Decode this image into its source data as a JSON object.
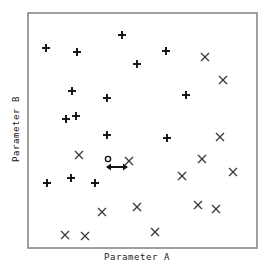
{
  "chart_data": {
    "type": "scatter",
    "title": "",
    "xlabel": "Parameter A",
    "ylabel": "Parameter B",
    "xlim": [
      0,
      100
    ],
    "ylim": [
      0,
      100
    ],
    "grid": false,
    "legend": null,
    "axis_ticks": {
      "x": [],
      "y": []
    },
    "frame": {
      "left": 28,
      "top": 13,
      "right": 257,
      "bottom": 248,
      "color": "#808080",
      "line_width": 1.5
    },
    "marker_color": "#111111",
    "series": [
      {
        "name": "plus-group",
        "marker": "plus",
        "color": "#111111",
        "points": [
          {
            "px": 46,
            "py": 48
          },
          {
            "px": 77,
            "py": 52
          },
          {
            "px": 122,
            "py": 35
          },
          {
            "px": 137,
            "py": 64
          },
          {
            "px": 166,
            "py": 51
          },
          {
            "px": 72,
            "py": 91
          },
          {
            "px": 107,
            "py": 98
          },
          {
            "px": 66,
            "py": 119
          },
          {
            "px": 76,
            "py": 116
          },
          {
            "px": 186,
            "py": 95
          },
          {
            "px": 107,
            "py": 135
          },
          {
            "px": 167,
            "py": 138
          },
          {
            "px": 71,
            "py": 178
          },
          {
            "px": 47,
            "py": 183
          },
          {
            "px": 95,
            "py": 183
          }
        ]
      },
      {
        "name": "cross-group",
        "marker": "cross",
        "color": "#3a3a3a",
        "points": [
          {
            "px": 205,
            "py": 57
          },
          {
            "px": 223,
            "py": 80
          },
          {
            "px": 220,
            "py": 137
          },
          {
            "px": 79,
            "py": 155
          },
          {
            "px": 129,
            "py": 161
          },
          {
            "px": 202,
            "py": 159
          },
          {
            "px": 182,
            "py": 176
          },
          {
            "px": 233,
            "py": 172
          },
          {
            "px": 102,
            "py": 212
          },
          {
            "px": 137,
            "py": 207
          },
          {
            "px": 198,
            "py": 205
          },
          {
            "px": 216,
            "py": 209
          },
          {
            "px": 65,
            "py": 235
          },
          {
            "px": 85,
            "py": 236
          },
          {
            "px": 155,
            "py": 232
          }
        ]
      }
    ],
    "annotations": [
      {
        "name": "highlighted-point",
        "marker": "circle-open",
        "px": 108,
        "py": 159,
        "radius": 2.6,
        "color": "#111111"
      },
      {
        "name": "distance-arrow",
        "marker": "double-headed-arrow",
        "x1": 106,
        "x2": 128,
        "py": 167,
        "color": "#111111"
      }
    ]
  }
}
